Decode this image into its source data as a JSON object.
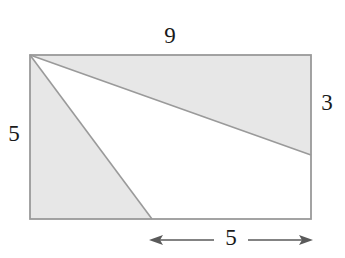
{
  "figure": {
    "kind": "geometry-diagram",
    "background_color": "#ffffff",
    "shade_color": "#e7e7e7",
    "unshaded_color": "#ffffff",
    "stroke_color": "#9a9a9a",
    "label_color": "#1a1a1a",
    "arrow_color": "#5a5a5a"
  },
  "rectangle": {
    "x": 30,
    "y": 55,
    "width": 281,
    "height": 164,
    "units_width": 9,
    "units_height": 5
  },
  "points": {
    "top_left": [
      30,
      55
    ],
    "top_right": [
      311,
      55
    ],
    "bottom_right": [
      311,
      219
    ],
    "bottom_left": [
      30,
      219
    ],
    "right_edge_intersection": [
      311,
      155
    ],
    "bottom_edge_intersection": [
      152,
      219
    ]
  },
  "regions": [
    {
      "name": "upper-shaded-region",
      "shaded": true,
      "polygon": "30,55 311,55 311,155"
    },
    {
      "name": "lower-left-shaded-region",
      "shaded": true,
      "polygon": "30,55 152,219 30,219"
    },
    {
      "name": "central-white-triangle",
      "shaded": false,
      "polygon": "30,55 311,155 311,219 152,219"
    }
  ],
  "labels": {
    "top": {
      "text": "9",
      "x": 170,
      "y": 38,
      "meaning": "rectangle top side length"
    },
    "left": {
      "text": "5",
      "x": 14,
      "y": 136,
      "meaning": "rectangle left side length"
    },
    "right": {
      "text": "3",
      "x": 327,
      "y": 105,
      "meaning": "segment from top-right corner down to upper line intersection"
    },
    "bottom": {
      "text": "5",
      "x": 231,
      "y": 240,
      "meaning": "distance along bottom edge from lower line intersection to bottom-right corner"
    }
  },
  "dimension_line": {
    "name": "bottom-dimension",
    "y": 240,
    "x_start": 149,
    "x_end": 313,
    "label": "5",
    "arrow_left": "left-arrowhead",
    "arrow_right": "right-arrowhead"
  }
}
